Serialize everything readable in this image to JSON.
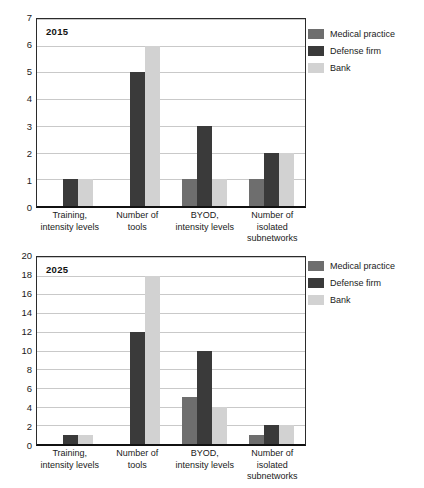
{
  "colors": {
    "medical_practice": "#6e6e6e",
    "defense_firm": "#3a3a3a",
    "bank": "#d2d2d2",
    "gridline": "#c9c9c9",
    "axis": "#111111",
    "background": "#ffffff",
    "text": "#1a1a1a"
  },
  "legend": {
    "items": [
      {
        "label": "Medical practice",
        "color": "#6e6e6e"
      },
      {
        "label": "Defense firm",
        "color": "#3a3a3a"
      },
      {
        "label": "Bank",
        "color": "#d2d2d2"
      }
    ]
  },
  "chart_data": [
    {
      "type": "bar",
      "title": "2015",
      "xlabel": "",
      "ylabel": "",
      "ylim": [
        0,
        7
      ],
      "yticks": [
        0,
        1,
        2,
        3,
        4,
        5,
        6,
        7
      ],
      "grid": true,
      "legend_position": "right",
      "categories": [
        "Training, intensity levels",
        "Number of tools",
        "BYOD, intensity levels",
        "Number of isolated subnetworks"
      ],
      "category_lines": [
        [
          "Training,",
          "intensity levels"
        ],
        [
          "Number of",
          "tools"
        ],
        [
          "BYOD,",
          "intensity levels"
        ],
        [
          "Number of",
          "isolated",
          "subnetworks"
        ]
      ],
      "series": [
        {
          "name": "Medical practice",
          "color": "#6e6e6e",
          "values": [
            0,
            0,
            1,
            1
          ]
        },
        {
          "name": "Defense firm",
          "color": "#3a3a3a",
          "values": [
            1,
            5,
            3,
            2
          ]
        },
        {
          "name": "Bank",
          "color": "#d2d2d2",
          "values": [
            1,
            6,
            1,
            2
          ]
        }
      ]
    },
    {
      "type": "bar",
      "title": "2025",
      "xlabel": "",
      "ylabel": "",
      "ylim": [
        0,
        20
      ],
      "yticks": [
        0,
        2,
        4,
        6,
        8,
        10,
        12,
        14,
        16,
        18,
        20
      ],
      "grid": true,
      "legend_position": "right",
      "categories": [
        "Training, intensity levels",
        "Number of tools",
        "BYOD, intensity levels",
        "Number of isolated subnetworks"
      ],
      "category_lines": [
        [
          "Training,",
          "intensity levels"
        ],
        [
          "Number of",
          "tools"
        ],
        [
          "BYOD,",
          "intensity levels"
        ],
        [
          "Number of",
          "isolated",
          "subnetworks"
        ]
      ],
      "series": [
        {
          "name": "Medical practice",
          "color": "#6e6e6e",
          "values": [
            0,
            0,
            5,
            1
          ]
        },
        {
          "name": "Defense firm",
          "color": "#3a3a3a",
          "values": [
            1,
            12,
            10,
            2
          ]
        },
        {
          "name": "Bank",
          "color": "#d2d2d2",
          "values": [
            1,
            18,
            4,
            2
          ]
        }
      ]
    }
  ]
}
